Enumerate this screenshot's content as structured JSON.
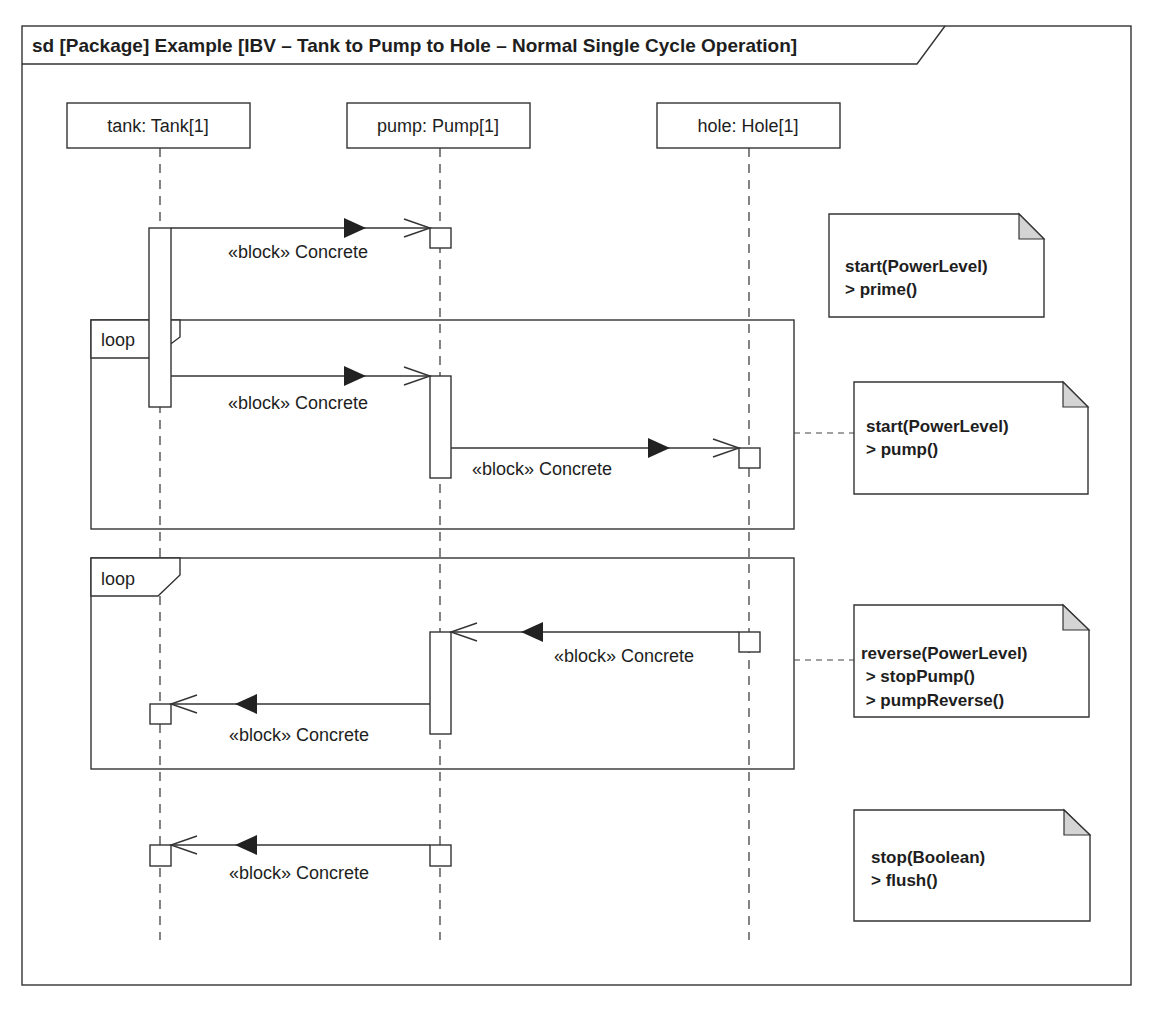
{
  "diagram": {
    "title": "sd [Package] Example [IBV – Tank to Pump to Hole – Normal Single Cycle Operation]",
    "lifelines": [
      {
        "label": "tank: Tank[1]",
        "x": 160
      },
      {
        "label": "pump: Pump[1]",
        "x": 440
      },
      {
        "label": "hole: Hole[1]",
        "x": 749
      }
    ],
    "fragments": [
      {
        "operator": "loop"
      },
      {
        "operator": "loop"
      }
    ],
    "messages": [
      {
        "from": "tank",
        "to": "pump",
        "label": "«block» Concrete"
      },
      {
        "from": "tank",
        "to": "pump",
        "label": "«block» Concrete"
      },
      {
        "from": "pump",
        "to": "hole",
        "label": "«block» Concrete"
      },
      {
        "from": "hole",
        "to": "pump",
        "label": "«block» Concrete"
      },
      {
        "from": "pump",
        "to": "tank",
        "label": "«block» Concrete"
      },
      {
        "from": "pump",
        "to": "tank",
        "label": "«block» Concrete"
      }
    ],
    "notes": [
      {
        "lines": [
          "start(PowerLevel)",
          "> prime()"
        ]
      },
      {
        "lines": [
          "start(PowerLevel)",
          "> pump()"
        ]
      },
      {
        "lines": [
          "reverse(PowerLevel)",
          " > stopPump()",
          " > pumpReverse()"
        ]
      },
      {
        "lines": [
          "stop(Boolean)",
          "> flush()"
        ]
      }
    ],
    "colors": {
      "line": "#333333",
      "note_fold": "#d4d4d4",
      "text": "#1e1e1e",
      "background": "#ffffff"
    }
  }
}
